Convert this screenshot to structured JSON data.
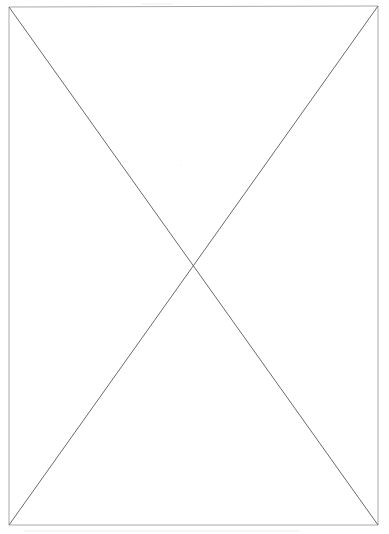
{
  "page": {
    "background_color": "#ffffff",
    "width_px": 389,
    "height_px": 534
  },
  "figure": {
    "name": "crossed-box-placeholder",
    "kind": "line-drawing",
    "shape": "rectangle-with-diagonals",
    "frame": {
      "border_color": "#a8a8a8",
      "border_width_px": 1,
      "fill_color": "#ffffff",
      "corners": {
        "top_left": {
          "x": 9,
          "y": 7
        },
        "top_right": {
          "x": 378,
          "y": 6
        },
        "bottom_right": {
          "x": 378,
          "y": 525
        },
        "bottom_left": {
          "x": 9,
          "y": 525
        }
      },
      "width_px": 369,
      "height_px": 518
    },
    "diagonals": {
      "color": "#6a6a6a",
      "width_px": 1,
      "lines": [
        {
          "name": "diagonal-top-left-to-bottom-right",
          "x1": 9,
          "y1": 7,
          "x2": 378,
          "y2": 525
        },
        {
          "name": "diagonal-top-right-to-bottom-left",
          "x1": 378,
          "y1": 6,
          "x2": 9,
          "y2": 525
        }
      ],
      "intersection": {
        "x": 193,
        "y": 266
      }
    }
  },
  "artifacts": {
    "color": "#b9b9b9",
    "marks": [
      {
        "name": "scan-smudge-top-edge",
        "x1": 142,
        "y1": 4,
        "x2": 172,
        "y2": 4
      },
      {
        "name": "scan-smudge-below-frame",
        "x1": 24,
        "y1": 531,
        "x2": 300,
        "y2": 531
      },
      {
        "name": "scan-speck-upper-center",
        "cx": 181,
        "cy": 165,
        "r": 1.1
      }
    ]
  }
}
